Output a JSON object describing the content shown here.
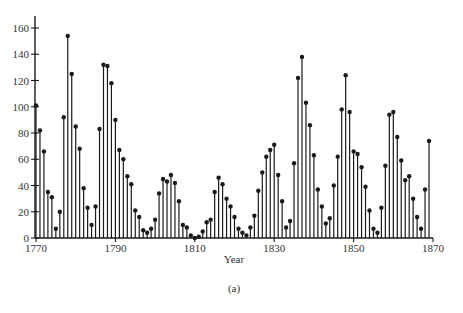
{
  "chart_data": {
    "type": "stem",
    "title": "",
    "caption": "(a)",
    "xlabel": "Year",
    "ylabel": "",
    "xlim": [
      1770,
      1870
    ],
    "ylim": [
      0,
      160
    ],
    "x_ticks": [
      1770,
      1790,
      1810,
      1830,
      1850,
      1870
    ],
    "y_ticks": [
      0,
      20,
      40,
      60,
      80,
      100,
      120,
      140,
      160
    ],
    "grid": false,
    "legend": null,
    "x": [
      1770,
      1771,
      1772,
      1773,
      1774,
      1775,
      1776,
      1777,
      1778,
      1779,
      1780,
      1781,
      1782,
      1783,
      1784,
      1785,
      1786,
      1787,
      1788,
      1789,
      1790,
      1791,
      1792,
      1793,
      1794,
      1795,
      1796,
      1797,
      1798,
      1799,
      1800,
      1801,
      1802,
      1803,
      1804,
      1805,
      1806,
      1807,
      1808,
      1809,
      1810,
      1811,
      1812,
      1813,
      1814,
      1815,
      1816,
      1817,
      1818,
      1819,
      1820,
      1821,
      1822,
      1823,
      1824,
      1825,
      1826,
      1827,
      1828,
      1829,
      1830,
      1831,
      1832,
      1833,
      1834,
      1835,
      1836,
      1837,
      1838,
      1839,
      1840,
      1841,
      1842,
      1843,
      1844,
      1845,
      1846,
      1847,
      1848,
      1849,
      1850,
      1851,
      1852,
      1853,
      1854,
      1855,
      1856,
      1857,
      1858,
      1859,
      1860,
      1861,
      1862,
      1863,
      1864,
      1865,
      1866,
      1867,
      1868,
      1869
    ],
    "values": [
      101,
      82,
      66,
      35,
      31,
      7,
      20,
      92,
      154,
      125,
      85,
      68,
      38,
      23,
      10,
      24,
      83,
      132,
      131,
      118,
      90,
      67,
      60,
      47,
      41,
      21,
      16,
      6,
      4,
      7,
      14,
      34,
      45,
      43,
      48,
      42,
      28,
      10,
      8,
      2,
      0,
      1,
      5,
      12,
      14,
      35,
      46,
      41,
      30,
      24,
      16,
      7,
      4,
      2,
      8,
      17,
      36,
      50,
      62,
      67,
      71,
      48,
      28,
      8,
      13,
      57,
      122,
      138,
      103,
      86,
      63,
      37,
      24,
      11,
      15,
      40,
      62,
      98,
      124,
      96,
      66,
      64,
      54,
      39,
      21,
      7,
      4,
      23,
      55,
      94,
      96,
      77,
      59,
      44,
      47,
      30,
      16,
      7,
      37,
      74
    ],
    "series_style": {
      "color": "#1a1a1a",
      "marker": "filled-circle"
    }
  }
}
